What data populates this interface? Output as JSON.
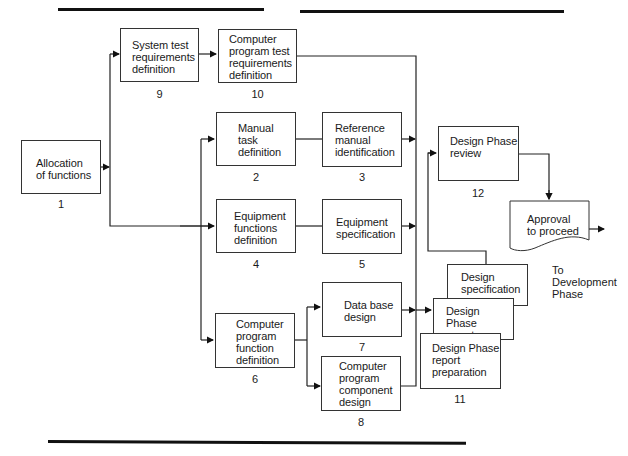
{
  "diagram": {
    "nodes": [
      {
        "id": "1",
        "label": "Allocation\nof functions",
        "number": "1"
      },
      {
        "id": "2",
        "label": "Manual\ntask\ndefinition",
        "number": "2"
      },
      {
        "id": "3",
        "label": "Reference\nmanual\nidentification",
        "number": "3"
      },
      {
        "id": "4",
        "label": "Equipment\nfunctions\ndefinition",
        "number": "4"
      },
      {
        "id": "5",
        "label": "Equipment\nspecification",
        "number": "5"
      },
      {
        "id": "6",
        "label": "Computer\nprogram\nfunction\ndefinition",
        "number": "6"
      },
      {
        "id": "7",
        "label": "Data base\ndesign",
        "number": "7"
      },
      {
        "id": "8",
        "label": "Computer\nprogram\ncomponent\ndesign",
        "number": "8"
      },
      {
        "id": "9",
        "label": "System test\nrequirements\ndefinition",
        "number": "9"
      },
      {
        "id": "10",
        "label": "Computer\nprogram test\nrequirements\ndefinition",
        "number": "10"
      },
      {
        "id": "11",
        "label": "Design Phase\nreport\npreparation",
        "number": "11"
      },
      {
        "id": "12",
        "label": "Design Phase\nreview",
        "number": "12"
      }
    ],
    "documents": {
      "design_specification": "Design\nspecification",
      "design_phase_report": "Design Phase\nreport",
      "approval": "Approval\nto proceed"
    },
    "exit_label": "To\nDevelopment\nPhase",
    "edges": [
      [
        "1",
        "9"
      ],
      [
        "1",
        "4"
      ],
      [
        "9",
        "10"
      ],
      [
        "4",
        "2"
      ],
      [
        "4",
        "6"
      ],
      [
        "2",
        "3"
      ],
      [
        "4",
        "5"
      ],
      [
        "6",
        "7"
      ],
      [
        "6",
        "8"
      ],
      [
        "10",
        "11"
      ],
      [
        "3",
        "11"
      ],
      [
        "5",
        "11"
      ],
      [
        "7",
        "11"
      ],
      [
        "8",
        "11"
      ],
      [
        "11",
        "12"
      ],
      [
        "12",
        "approval"
      ],
      [
        "approval",
        "development"
      ]
    ]
  }
}
